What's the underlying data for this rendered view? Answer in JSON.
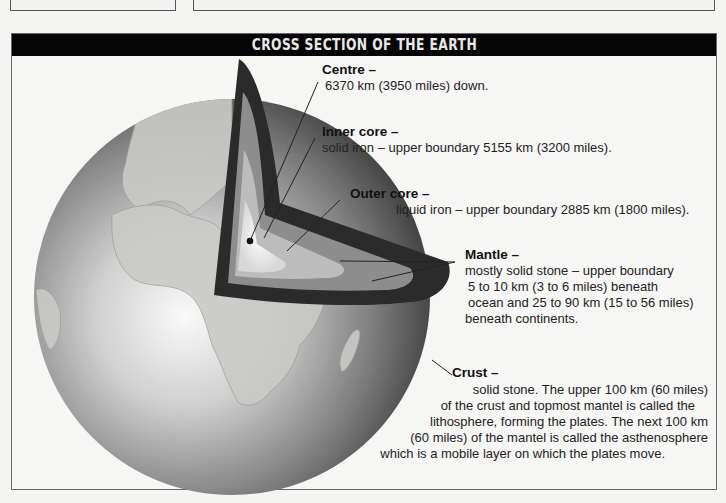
{
  "title": "CROSS SECTION OF THE EARTH",
  "labels": {
    "centre": {
      "heading": "Centre –",
      "lines": [
        "6370 km (3950 miles) down."
      ]
    },
    "inner_core": {
      "heading": "Inner core –",
      "lines": [
        "solid iron – upper boundary 5155 km (3200 miles)."
      ]
    },
    "outer_core": {
      "heading": "Outer core –",
      "lines": [
        "liquid iron – upper boundary 2885 km (1800 miles)."
      ]
    },
    "mantle": {
      "heading": "Mantle –",
      "lines": [
        "mostly solid stone – upper boundary",
        "5 to 10 km (3 to 6 miles) beneath",
        "ocean and 25 to 90 km (15 to 56 miles)",
        "beneath continents."
      ]
    },
    "crust": {
      "heading": "Crust –",
      "lines": [
        "solid stone. The upper 100 km (60 miles)",
        "of the crust and topmost mantel is called the",
        "lithosphere, forming the plates. The next 100 km",
        "(60 miles) of the mantel is called the asthenosphere",
        "which is a mobile layer on which the plates move."
      ]
    }
  },
  "colors": {
    "title_bar": "#050505",
    "title_text": "#e8e8e8",
    "background": "#f6f6f4",
    "cut_dark": "#2a2a2a",
    "mantle": "#8a8a8a",
    "outer_core": "#bdbdbd",
    "inner_core": "#e6e6e6"
  }
}
